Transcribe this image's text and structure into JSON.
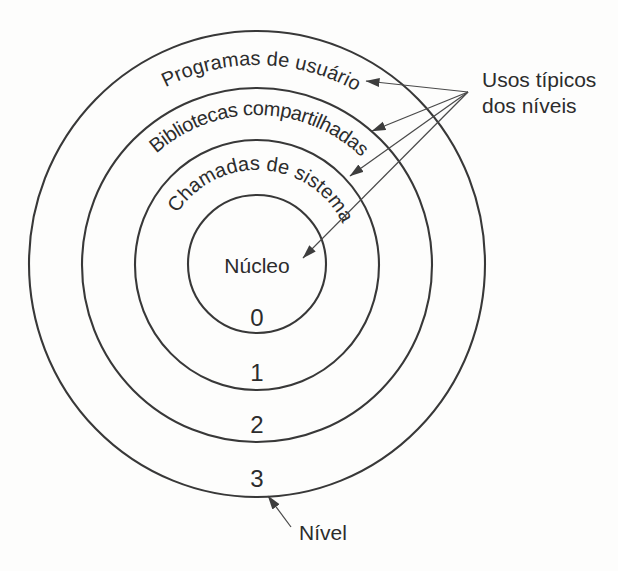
{
  "figure": {
    "type": "concentric-protection-rings-diagram",
    "language": "pt-BR",
    "colors": {
      "background": "#fdfdfc",
      "line": "#383838",
      "arrow": "#4a4a4a",
      "text": "#2c2c2c"
    },
    "rings": [
      {
        "level": "0",
        "label": "Núcleo"
      },
      {
        "level": "1",
        "label": "Chamadas de sistema"
      },
      {
        "level": "2",
        "label": "Bibliotecas compartilhadas"
      },
      {
        "level": "3",
        "label": "Programas de usuário"
      }
    ],
    "callout": {
      "line1": "Usos típicos",
      "line2": "dos níveis",
      "arrow_count": 4
    },
    "level_pointer": {
      "label": "Nível"
    }
  }
}
